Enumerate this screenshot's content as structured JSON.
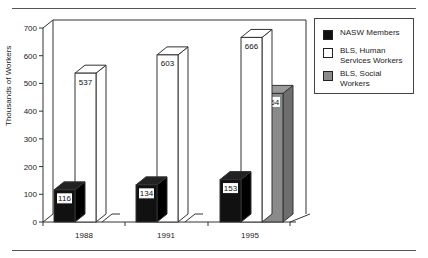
{
  "chart_data": {
    "type": "bar",
    "title": "",
    "xlabel": "",
    "ylabel": "Thousands of Workers",
    "ylim": [
      0,
      700
    ],
    "yticks": [
      0,
      100,
      200,
      300,
      400,
      500,
      600,
      700
    ],
    "categories": [
      "1988",
      "1991",
      "1995"
    ],
    "series": [
      {
        "name": "NASW Members",
        "color": "#111111",
        "values": [
          116,
          134,
          153
        ]
      },
      {
        "name": "BLS, Human Services Workers",
        "color": "#ffffff",
        "values": [
          537,
          603,
          666
        ]
      },
      {
        "name": "BLS, Social Workers",
        "color": "#8a8a8a",
        "values": [
          null,
          null,
          464
        ]
      }
    ],
    "data_labels": true,
    "style": "3d-bar",
    "grid": false,
    "legend_position": "right"
  },
  "legend": {
    "items": [
      {
        "label": "NASW Members",
        "color": "#111111"
      },
      {
        "label": "BLS, Human Services Workers",
        "color": "#ffffff"
      },
      {
        "label": "BLS, Social Workers",
        "color": "#8a8a8a"
      }
    ]
  },
  "axis": {
    "ylabel": "Thousands of Workers"
  }
}
